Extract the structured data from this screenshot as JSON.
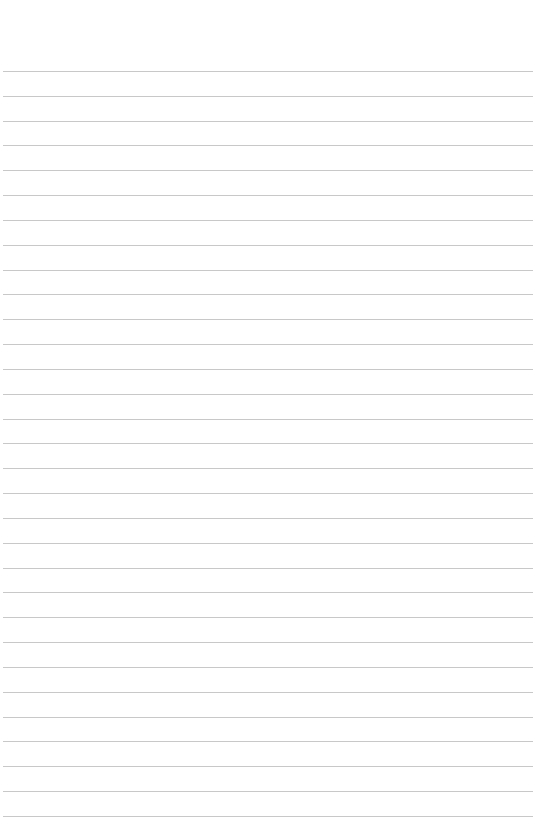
{
  "page": {
    "type": "lined-paper",
    "background_color": "#ffffff",
    "line_color": "#c8c8c8",
    "first_line_y": 71,
    "line_spacing": 24.83,
    "line_count": 31
  }
}
